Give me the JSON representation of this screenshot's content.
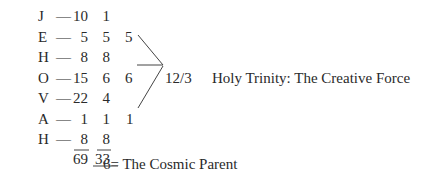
{
  "rows": [
    {
      "letter": "J",
      "dash": "—",
      "value": "10",
      "reduced": "1"
    },
    {
      "letter": "E",
      "dash": "— ",
      "value": "5",
      "reduced": "5"
    },
    {
      "letter": "H",
      "dash": "— ",
      "value": "8",
      "reduced": "8"
    },
    {
      "letter": "O",
      "dash": "—",
      "value": "15",
      "reduced": "6"
    },
    {
      "letter": "V",
      "dash": "—",
      "value": "22",
      "reduced": "4"
    },
    {
      "letter": "A",
      "dash": "— ",
      "value": "1",
      "reduced": "1"
    },
    {
      "letter": "H",
      "dash": "— ",
      "value": "8",
      "reduced": "8"
    }
  ],
  "totals": {
    "value_sum": "69",
    "reduced_sum": "33",
    "connector": "____"
  },
  "trinity": {
    "inputs": [
      "5",
      "6",
      "1"
    ],
    "result": "12/3",
    "label": "Holy Trinity: The Creative Force"
  },
  "cosmic_parent": "6= The Cosmic Parent"
}
